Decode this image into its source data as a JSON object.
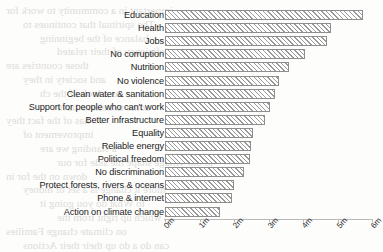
{
  "background": {
    "bleed_lines": [
      "important in a community to work for",
      "The spiritual that continues to",
      "balance of the beginning",
      "was deficiency of their related",
      "those countries are",
      "and society in they",
      "as a look of the ch",
      "some to believe have",
      "has of the fact they",
      "improvement of",
      "a standing we are",
      "to our village shape the side for our",
      "down on the for in",
      "more it change is a set of money",
      "to What do you going it",
      "which up right from the",
      "on climate change Families",
      "can do a do up their their Actions"
    ]
  },
  "chart_data": {
    "type": "bar",
    "orientation": "horizontal",
    "title": "",
    "xlabel": "",
    "ylabel": "",
    "xlim": [
      0,
      6
    ],
    "xticks": [
      0,
      1,
      2,
      3,
      4,
      5,
      6
    ],
    "xtick_labels": [
      "0m",
      "1m",
      "2m",
      "3m",
      "4m",
      "5m",
      "6m"
    ],
    "grid": false,
    "legend": "none",
    "bar_style": "hatched",
    "hatch": "/",
    "bar_edge_color": "#8e8e8e",
    "bar_fill_color": "#ffffff",
    "bar_hatch_color": "#9a9a9a",
    "categories": [
      "Education",
      "Health",
      "Jobs",
      "No corruption",
      "Nutrition",
      "No violence",
      "Clean water & sanitation",
      "Support for people who can't work",
      "Better infrastructure",
      "Equality",
      "Reliable energy",
      "Political freedom",
      "No discrimination",
      "Protect forests, rivers & oceans",
      "Phone & internet",
      "Action on climate change"
    ],
    "values": [
      5.75,
      4.8,
      4.7,
      4.05,
      3.6,
      3.3,
      3.2,
      3.05,
      2.9,
      2.55,
      2.5,
      2.45,
      2.3,
      2.0,
      1.95,
      1.6
    ],
    "units": "millions of votes"
  }
}
